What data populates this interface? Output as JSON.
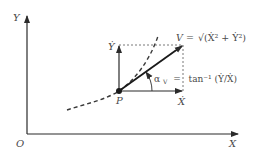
{
  "diagram": {
    "colors": {
      "line": "#2b2b2b",
      "text": "#4a4a4a",
      "dash": "#3a3a3a"
    },
    "axes": {
      "origin_label": "O",
      "x_label": "X",
      "y_label": "Y"
    },
    "point": {
      "label": "P"
    },
    "components": {
      "x_dot_label": "Ẋ",
      "y_dot_label": "Ẏ"
    },
    "velocity": {
      "label_lhs": "V =",
      "label_rhs": "√(Ẋ² + Ẏ²)"
    },
    "angle": {
      "symbol": "α",
      "subscript": "V",
      "equals": "=",
      "expression": "tan⁻¹ (Ẏ/Ẋ)"
    }
  }
}
